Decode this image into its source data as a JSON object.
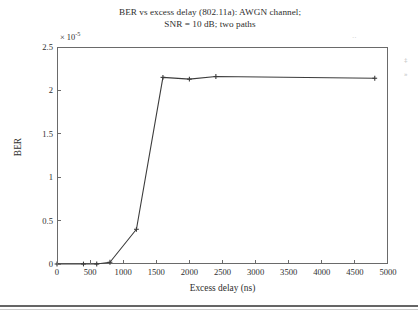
{
  "figure": {
    "title_line1": "BER vs excess delay (802.11a): AWGN channel;",
    "title_line2": "SNR = 10 dB; two paths",
    "background_color": "#ffffff",
    "axis_color": "#6a6a6a",
    "line_color": "#3c3c3c"
  },
  "axes": {
    "y_exponent_prefix": "× 10",
    "y_exponent_power": "-5",
    "ylabel": "BER",
    "xlabel": "Excess delay (ns)",
    "ytick_labels": [
      "0",
      "0.5",
      "1",
      "1.5",
      "2",
      "2.5"
    ],
    "xtick_labels": [
      "0",
      "500",
      "1000",
      "1500",
      "2000",
      "2500",
      "3000",
      "3500",
      "4000",
      "4500",
      "5000"
    ]
  },
  "artifacts": {
    "right_speck_1": "‡",
    "right_speck_2": "»",
    "top_speck": "··"
  },
  "chart_data": {
    "type": "line",
    "title": "BER vs excess delay (802.11a): AWGN channel; SNR = 10 dB; two paths",
    "xlabel": "Excess delay (ns)",
    "ylabel": "BER",
    "y_scale_multiplier": 1e-05,
    "xlim": [
      0,
      5000
    ],
    "ylim": [
      0,
      2.5
    ],
    "xticks": [
      0,
      500,
      1000,
      1500,
      2000,
      2500,
      3000,
      3500,
      4000,
      4500,
      5000
    ],
    "yticks": [
      0,
      0.5,
      1,
      1.5,
      2,
      2.5
    ],
    "grid": false,
    "legend": false,
    "marker": "plus",
    "series": [
      {
        "name": "BER",
        "x": [
          0,
          400,
          600,
          800,
          1200,
          1600,
          2000,
          2400,
          4800
        ],
        "values": [
          0.0,
          0.0,
          0.0,
          0.02,
          0.4,
          2.15,
          2.13,
          2.16,
          2.14
        ]
      }
    ]
  }
}
